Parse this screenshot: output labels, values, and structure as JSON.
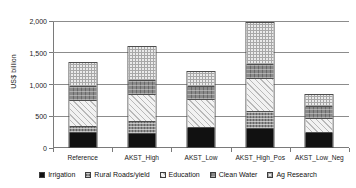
{
  "chart_data": {
    "type": "bar",
    "subtype": "stacked",
    "title": "",
    "xlabel": "",
    "ylabel": "US$ billion",
    "ylim": [
      0,
      2000
    ],
    "yticks": [
      0,
      500,
      1000,
      1500,
      2000
    ],
    "ytick_labels": [
      "0",
      "500",
      "1,000",
      "1,500",
      "2,000"
    ],
    "grid": true,
    "legend_position": "bottom",
    "categories": [
      "Reference",
      "AKST_High",
      "AKST_Low",
      "AKST_High_Pos",
      "AKST_Low_Neg"
    ],
    "series": [
      {
        "name": "Irrigation",
        "pattern": "solid-black",
        "values": [
          220,
          205,
          300,
          285,
          220
        ]
      },
      {
        "name": "Rural Roads/yield",
        "pattern": "dark-grid",
        "values": [
          95,
          190,
          0,
          265,
          0
        ]
      },
      {
        "name": "Education",
        "pattern": "light-diagonal",
        "values": [
          410,
          425,
          440,
          520,
          220
        ]
      },
      {
        "name": "Clean Water",
        "pattern": "mid-grid",
        "values": [
          225,
          220,
          205,
          220,
          190
        ]
      },
      {
        "name": "Ag Research",
        "pattern": "light-grid",
        "values": [
          370,
          535,
          235,
          665,
          190
        ]
      }
    ],
    "totals": [
      1320,
      1575,
      1180,
      1955,
      820
    ]
  },
  "axis": {
    "y_title": "US$ billion"
  },
  "legend": {
    "items": [
      {
        "label": "Irrigation"
      },
      {
        "label": "Rural Roads/yield"
      },
      {
        "label": "Education"
      },
      {
        "label": "Clean Water"
      },
      {
        "label": "Ag Research"
      }
    ]
  }
}
